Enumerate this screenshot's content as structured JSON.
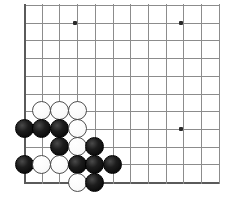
{
  "diagram": {
    "board": {
      "type": "go-board",
      "corner": "bottom-left",
      "grid_origin_x": 24,
      "grid_origin_y": 182,
      "grid_spacing": 17.7,
      "columns_visible": 12,
      "rows_visible": 11,
      "line_color": "#8c8c8c",
      "edge_color": "#5a5a5a",
      "background_color": "#ffffff"
    },
    "star_points": [
      {
        "name": "star-point-top-left",
        "x": 75,
        "y": 23
      },
      {
        "name": "star-point-top-right",
        "x": 181,
        "y": 23
      },
      {
        "name": "star-point-lower-right",
        "x": 181,
        "y": 129
      }
    ],
    "stones": [
      {
        "id": "w1",
        "color": "white",
        "x": 41,
        "y": 110
      },
      {
        "id": "w2",
        "color": "white",
        "x": 59,
        "y": 110
      },
      {
        "id": "w3",
        "color": "white",
        "x": 77,
        "y": 110
      },
      {
        "id": "b1",
        "color": "black",
        "x": 24,
        "y": 128
      },
      {
        "id": "b2",
        "color": "black",
        "x": 41,
        "y": 128
      },
      {
        "id": "b3",
        "color": "black",
        "x": 59,
        "y": 128
      },
      {
        "id": "w4",
        "color": "white",
        "x": 77,
        "y": 128
      },
      {
        "id": "b4",
        "color": "black",
        "x": 59,
        "y": 146
      },
      {
        "id": "w5",
        "color": "white",
        "x": 77,
        "y": 146
      },
      {
        "id": "b5",
        "color": "black",
        "x": 94,
        "y": 146
      },
      {
        "id": "b6",
        "color": "black",
        "x": 24,
        "y": 164
      },
      {
        "id": "w6",
        "color": "white",
        "x": 41,
        "y": 164
      },
      {
        "id": "w7",
        "color": "white",
        "x": 59,
        "y": 164
      },
      {
        "id": "b7",
        "color": "black",
        "x": 77,
        "y": 164
      },
      {
        "id": "b8",
        "color": "black",
        "x": 94,
        "y": 164
      },
      {
        "id": "b9",
        "color": "black",
        "x": 112,
        "y": 164
      },
      {
        "id": "w8",
        "color": "white",
        "x": 77,
        "y": 182
      },
      {
        "id": "b10",
        "color": "black",
        "x": 94,
        "y": 182
      }
    ],
    "stone_diameter": 19,
    "counts": {
      "black_stones": 10,
      "white_stones": 8,
      "total_stones": 18
    }
  }
}
